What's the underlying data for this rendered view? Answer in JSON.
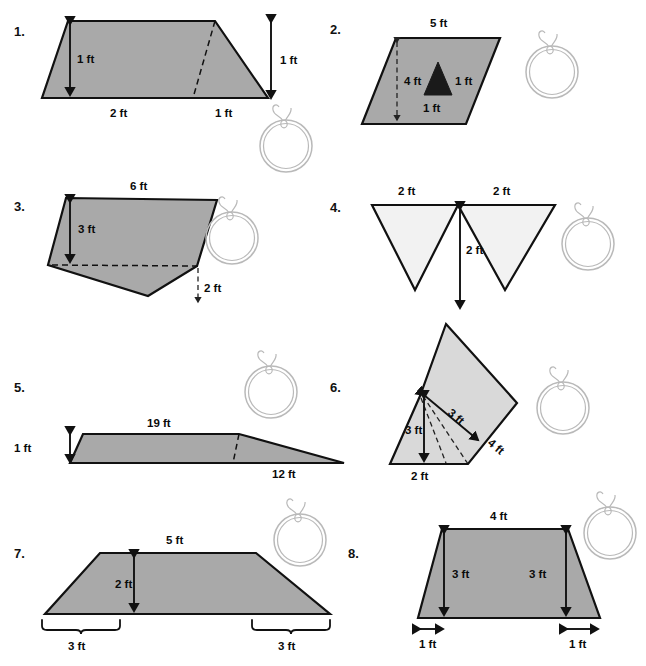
{
  "page": {
    "background_color": "#ffffff",
    "fill_dark": "#a9a9a9",
    "fill_mid": "#d9d9d9",
    "fill_light": "#f2f2f2",
    "fill_black": "#1a1a1a",
    "stroke_color": "#111111",
    "decoration_color": "#b9b9b9"
  },
  "problems": [
    {
      "number": "1.",
      "shape": "trapezoid",
      "labels": [
        {
          "id": "height-inner",
          "text": "1 ft"
        },
        {
          "id": "height-outer",
          "text": "1 ft"
        },
        {
          "id": "base-left",
          "text": "2 ft"
        },
        {
          "id": "base-right",
          "text": "1 ft"
        }
      ],
      "decoration": "pencil-ring-icon"
    },
    {
      "number": "2.",
      "shape": "parallelogram-with-triangle-hole",
      "labels": [
        {
          "id": "top",
          "text": "5 ft"
        },
        {
          "id": "height",
          "text": "4 ft"
        },
        {
          "id": "triangle-height",
          "text": "1 ft"
        },
        {
          "id": "triangle-base",
          "text": "1 ft"
        }
      ],
      "decoration": "pencil-ring-icon"
    },
    {
      "number": "3.",
      "shape": "irregular-quadrilateral",
      "labels": [
        {
          "id": "top",
          "text": "6 ft"
        },
        {
          "id": "height-upper",
          "text": "3 ft"
        },
        {
          "id": "height-lower",
          "text": "2 ft"
        }
      ],
      "decoration": "pencil-ring-icon"
    },
    {
      "number": "4.",
      "shape": "two-inverted-triangles",
      "labels": [
        {
          "id": "base-left",
          "text": "2 ft"
        },
        {
          "id": "base-right",
          "text": "2 ft"
        },
        {
          "id": "height",
          "text": "2 ft"
        }
      ],
      "decoration": "pencil-ring-icon"
    },
    {
      "number": "5.",
      "shape": "long-ramp-trapezoid",
      "labels": [
        {
          "id": "height",
          "text": "1 ft"
        },
        {
          "id": "top",
          "text": "19 ft"
        },
        {
          "id": "slope-base",
          "text": "12 ft"
        }
      ],
      "decoration": "pencil-ring-icon"
    },
    {
      "number": "6.",
      "shape": "rotated-composite-prism",
      "labels": [
        {
          "id": "diagonal",
          "text": "3 ft"
        },
        {
          "id": "height",
          "text": "3 ft"
        },
        {
          "id": "side",
          "text": "4 ft"
        },
        {
          "id": "base",
          "text": "2 ft"
        }
      ],
      "decoration": "pencil-ring-icon"
    },
    {
      "number": "7.",
      "shape": "wide-trapezoid",
      "labels": [
        {
          "id": "top",
          "text": "5 ft"
        },
        {
          "id": "height",
          "text": "2 ft"
        },
        {
          "id": "leg-left",
          "text": "3 ft"
        },
        {
          "id": "leg-right",
          "text": "3 ft"
        }
      ],
      "decoration": "pencil-ring-icon"
    },
    {
      "number": "8.",
      "shape": "trapezoid",
      "labels": [
        {
          "id": "top",
          "text": "4 ft"
        },
        {
          "id": "height-left",
          "text": "3 ft"
        },
        {
          "id": "height-right",
          "text": "3 ft"
        },
        {
          "id": "offset-left",
          "text": "1 ft"
        },
        {
          "id": "offset-right",
          "text": "1 ft"
        }
      ],
      "decoration": "pencil-ring-icon"
    }
  ]
}
